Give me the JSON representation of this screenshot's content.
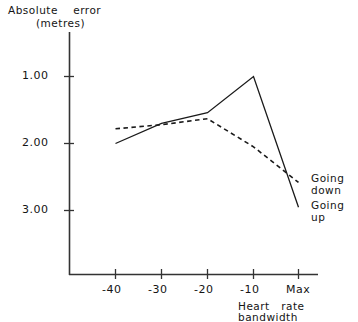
{
  "chart_data": {
    "type": "line",
    "title": "Absolute error (metres)",
    "title_line1": "Absolute    error",
    "title_line2": "(metres)",
    "xlabel": "Heart  rate bandwidth",
    "xlabel_line1": "Heart   rate",
    "xlabel_line2": "bandwidth",
    "ylabel": "Absolute error (metres)",
    "x": [
      "-40",
      "-30",
      "-20",
      "-10",
      "Max"
    ],
    "xtick_labels": [
      "-40",
      "-30",
      "-20",
      "-10",
      "Max"
    ],
    "ytick_labels": [
      "1.00",
      "2.00",
      "3.00"
    ],
    "ytick_values": [
      1.0,
      2.0,
      3.0
    ],
    "ylim": [
      0.45,
      3.35
    ],
    "y_axis_inverted": true,
    "grid": false,
    "legend_position": "right-inside",
    "series": [
      {
        "name": "Going up",
        "style": "solid",
        "color": "#1a1a1a",
        "values": [
          2.0,
          1.7,
          1.54,
          1.0,
          2.95
        ]
      },
      {
        "name": "Going down",
        "style": "dashed",
        "color": "#1a1a1a",
        "values": [
          1.78,
          1.72,
          1.63,
          2.05,
          2.58
        ]
      }
    ],
    "annotations": [
      {
        "id": "legend-down",
        "text_line1": "Going",
        "text_line2": "down"
      },
      {
        "id": "legend-up",
        "text_line1": "Going",
        "text_line2": "up"
      }
    ]
  },
  "legend": {
    "going_down_line1": "Going",
    "going_down_line2": "down",
    "going_up_line1": "Going",
    "going_up_line2": "up"
  },
  "colors": {
    "ink": "#1a1a1a",
    "background": "#ffffff"
  }
}
